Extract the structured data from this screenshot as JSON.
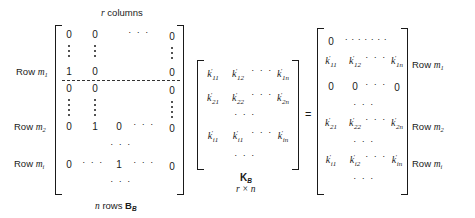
{
  "left_matrix": {
    "name": "B_B",
    "top_label": {
      "var": "r",
      "text": " columns"
    },
    "bottom_label": {
      "var": "n",
      "text": " rows ",
      "symbol": "B",
      "symbol_sub": "B"
    },
    "row_labels": [
      {
        "prefix": "Row ",
        "var": "m",
        "sub": "1"
      },
      {
        "prefix": "Row ",
        "var": "m",
        "sub": "2"
      },
      {
        "prefix": "Row ",
        "var": "m",
        "sub": "i"
      }
    ],
    "cells": {
      "r0": [
        "0",
        "0",
        "· · ·",
        "0"
      ],
      "rm1": [
        "1",
        "0",
        "0"
      ],
      "r_after_dash": [
        "0",
        "0",
        "0"
      ],
      "rm2": [
        "0",
        "1",
        "0",
        "· · ·",
        "0"
      ],
      "mid_dots": "· · ·",
      "rmi": [
        "0",
        "· · ·",
        "1",
        "· · ·",
        "0"
      ],
      "bottom_dots": "· · ·"
    }
  },
  "middle_matrix": {
    "name": "K_B",
    "label": {
      "symbol": "K",
      "symbol_sub": "B",
      "dims": "r × n"
    },
    "rows": [
      [
        {
          "k": "k",
          "sub": "11"
        },
        {
          "k": "k",
          "sub": "12"
        },
        {
          "dots": "· · ·"
        },
        {
          "k": "k",
          "sub": "1n"
        }
      ],
      [
        {
          "k": "k",
          "sub": "21"
        },
        {
          "k": "k",
          "sub": "22"
        },
        {
          "dots": "· · ·"
        },
        {
          "k": "k",
          "sub": "2n"
        }
      ],
      [
        {
          "k": "k",
          "sub": "i1"
        },
        {
          "k": "k",
          "sub": "i1"
        },
        {
          "dots": "· · ·"
        },
        {
          "k": "k",
          "sub": "in"
        }
      ]
    ],
    "dots": "· · ·",
    "prime": "′"
  },
  "equals": "=",
  "right_matrix": {
    "row0": {
      "zero": "0",
      "dots": "· · · · · · ·"
    },
    "row_m1": {
      "cells": [
        "11",
        "12",
        "· · ·",
        "1n"
      ],
      "label": {
        "prefix": "Row ",
        "var": "m",
        "sub": "1"
      }
    },
    "row_zeros": [
      "0",
      "0",
      "· · ·",
      "0"
    ],
    "dots": "· · ·",
    "row_m2": {
      "cells": [
        "21",
        "22",
        "· · ·",
        "2n"
      ],
      "label": {
        "prefix": "Row ",
        "var": "m",
        "sub": "2"
      }
    },
    "row_mi": {
      "cells": [
        "i1",
        "i2",
        "· · ·",
        "in"
      ],
      "label": {
        "prefix": "Row ",
        "var": "m",
        "sub": "i"
      }
    },
    "k": "k",
    "prime": "′"
  }
}
